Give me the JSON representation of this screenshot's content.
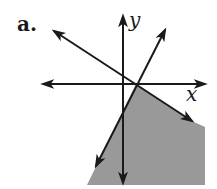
{
  "part_label": "a.",
  "axes": {
    "x_label": "x",
    "y_label": "y"
  },
  "colors": {
    "shade": "#999999",
    "line": "#1a1a1a",
    "background": "#ffffff"
  },
  "diagram": {
    "type": "linear-inequality-graph",
    "lines": [
      {
        "name": "line-negative-slope",
        "arrows": "both"
      },
      {
        "name": "line-positive-slope",
        "arrows": "both"
      }
    ],
    "shaded_region": "below both lines (lower-right region bounded by the two lines)"
  }
}
